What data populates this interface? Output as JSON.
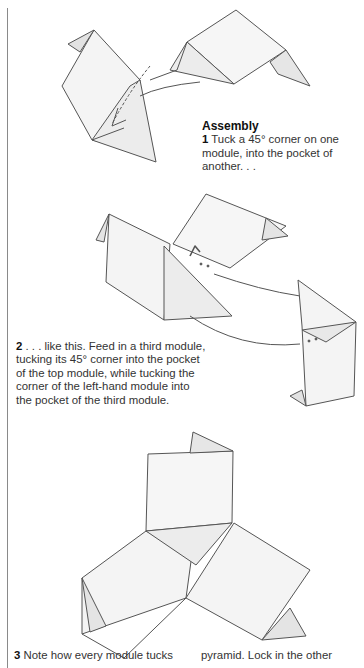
{
  "section_heading": "Assembly",
  "steps": [
    {
      "number": "1",
      "text": " Tuck a 45° corner on one module, into the pocket of another. . ."
    },
    {
      "number": "2",
      "text": " . . . like this. Feed in a third module, tucking its 45° corner into the pocket of the top module, while tucking the corner of the left-hand module into the pocket of the third module."
    },
    {
      "number": "3",
      "text": " Note how every module tucks"
    }
  ],
  "step3_continuation": "pyramid. Lock in the other",
  "colors": {
    "line": "#555555",
    "shade": "#e4e4e4",
    "rule": "#8a8a8a"
  }
}
